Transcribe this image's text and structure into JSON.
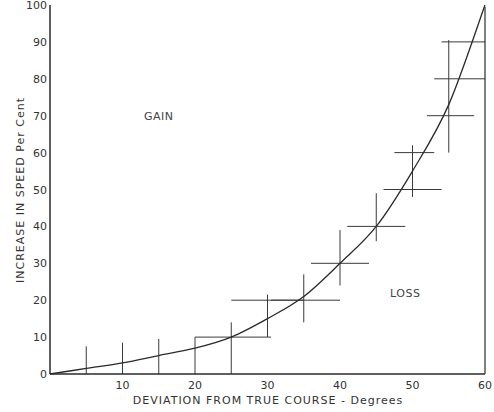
{
  "chart_data": {
    "type": "line",
    "title": "",
    "xlabel": "DEVIATION  FROM  TRUE  COURSE  -  Degrees",
    "ylabel": "INCREASE  IN  SPEED  Per Cent",
    "xlim": [
      0,
      60
    ],
    "ylim": [
      0,
      100
    ],
    "x_ticks": [
      0,
      10,
      20,
      30,
      40,
      50,
      60
    ],
    "x_tick_labels": [
      "",
      "10",
      "20",
      "30",
      "40",
      "50",
      "60"
    ],
    "y_ticks": [
      0,
      10,
      20,
      30,
      40,
      50,
      60,
      70,
      80,
      90,
      100
    ],
    "y_tick_labels": [
      "0",
      "10",
      "20",
      "30",
      "40",
      "50",
      "60",
      "70",
      "80",
      "90",
      "100"
    ],
    "grid": false,
    "legend": null,
    "annotations": [
      {
        "text": "GAIN",
        "x": 15,
        "y": 70
      },
      {
        "text": "LOSS",
        "x": 49,
        "y": 22
      }
    ],
    "curve": {
      "name": "Speed increase curve",
      "x": [
        0,
        5,
        10,
        15,
        20,
        25,
        30,
        35,
        40,
        45,
        50,
        55,
        60
      ],
      "y": [
        0,
        1.5,
        3,
        5,
        7,
        10,
        15,
        21,
        30,
        40,
        55,
        73,
        100
      ]
    },
    "error_bars": {
      "vertical": [
        {
          "x": 5,
          "y_low": 0,
          "y_high": 7.5
        },
        {
          "x": 10,
          "y_low": 0,
          "y_high": 8.5
        },
        {
          "x": 15,
          "y_low": 0,
          "y_high": 9.5
        },
        {
          "x": 20,
          "y_low": 0,
          "y_high": 10
        },
        {
          "x": 25,
          "y_low": 0,
          "y_high": 14
        },
        {
          "x": 30,
          "y_low": 10,
          "y_high": 21.5
        },
        {
          "x": 35,
          "y_low": 14,
          "y_high": 27
        },
        {
          "x": 40,
          "y_low": 24,
          "y_high": 39
        },
        {
          "x": 45,
          "y_low": 36,
          "y_high": 49
        },
        {
          "x": 50,
          "y_low": 48,
          "y_high": 62
        },
        {
          "x": 55,
          "y_low": 60,
          "y_high": 90.5
        }
      ],
      "horizontal": [
        {
          "y": 10,
          "x_low": 20,
          "x_high": 30.5
        },
        {
          "y": 20,
          "x_low": 25,
          "x_high": 35
        },
        {
          "y": 20,
          "x_low": 30.5,
          "x_high": 40
        },
        {
          "y": 30,
          "x_low": 36,
          "x_high": 44
        },
        {
          "y": 40,
          "x_low": 41,
          "x_high": 49
        },
        {
          "y": 50,
          "x_low": 46,
          "x_high": 54
        },
        {
          "y": 60,
          "x_low": 47.5,
          "x_high": 53
        },
        {
          "y": 70,
          "x_low": 52,
          "x_high": 58.5
        },
        {
          "y": 80,
          "x_low": 53,
          "x_high": 60
        },
        {
          "y": 90,
          "x_low": 54,
          "x_high": 60
        }
      ]
    }
  },
  "colors": {
    "line": "#2a2a2a",
    "bars": "#3a3a3a",
    "text": "#333333",
    "background": "#ffffff"
  }
}
